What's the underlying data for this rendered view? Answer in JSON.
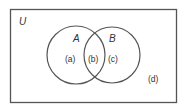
{
  "diagram": {
    "type": "venn",
    "universe_label": "U",
    "sets": [
      {
        "label": "A",
        "region_label": "(a)"
      },
      {
        "label": "B",
        "region_label": "(c)"
      }
    ],
    "intersection_label": "(b)",
    "outside_label": "(d)",
    "colors": {
      "stroke": "#555555",
      "text": "#333333",
      "background": "#ffffff"
    }
  }
}
